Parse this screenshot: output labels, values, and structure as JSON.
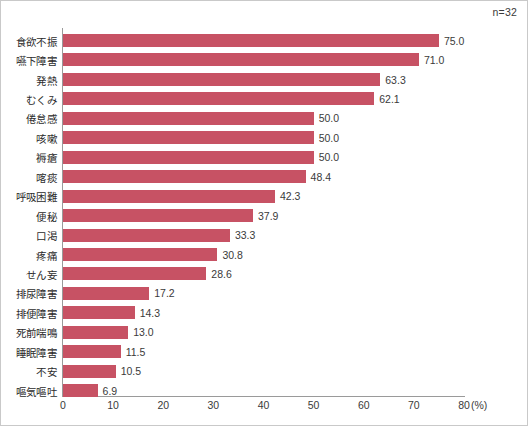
{
  "annotation": {
    "sample_size": "n=32"
  },
  "axis": {
    "unit_label": "(%)",
    "ticks": [
      "0",
      "10",
      "20",
      "30",
      "40",
      "50",
      "60",
      "70",
      "80"
    ]
  },
  "colors": {
    "bar": "#c75264",
    "axis": "#9a9a9a",
    "text": "#2b2b2b",
    "border": "#c9c9c9"
  },
  "chart_data": {
    "type": "bar",
    "orientation": "horizontal",
    "title": "",
    "subtitle": "",
    "xlabel": "(%)",
    "ylabel": "",
    "xlim": [
      0,
      80
    ],
    "xticks": [
      0,
      10,
      20,
      30,
      40,
      50,
      60,
      70,
      80
    ],
    "grid": false,
    "legend": null,
    "annotations": [
      "n=32"
    ],
    "categories": [
      "食欲不振",
      "嚥下障害",
      "発熱",
      "むくみ",
      "倦怠感",
      "咳嗽",
      "褥瘡",
      "喀痰",
      "呼吸困難",
      "便秘",
      "口渇",
      "疼痛",
      "せん妄",
      "排尿障害",
      "排便障害",
      "死前喘鳴",
      "睡眠障害",
      "不安",
      "嘔気嘔吐"
    ],
    "values": [
      75.0,
      71.0,
      63.3,
      62.1,
      50.0,
      50.0,
      50.0,
      48.4,
      42.3,
      37.9,
      33.3,
      30.8,
      28.6,
      17.2,
      14.3,
      13.0,
      11.5,
      10.5,
      6.9
    ],
    "value_labels": [
      "75.0",
      "71.0",
      "63.3",
      "62.1",
      "50.0",
      "50.0",
      "50.0",
      "48.4",
      "42.3",
      "37.9",
      "33.3",
      "30.8",
      "28.6",
      "17.2",
      "14.3",
      "13.0",
      "11.5",
      "10.5",
      "6.9"
    ]
  }
}
